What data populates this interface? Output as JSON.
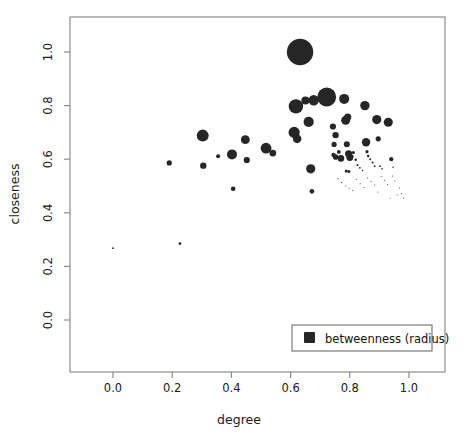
{
  "chart_data": {
    "type": "scatter",
    "title": "",
    "subtitle": "",
    "xlabel": "degree",
    "ylabel": "closeness",
    "xlim": [
      -0.115,
      1.115
    ],
    "ylim": [
      -0.135,
      1.135
    ],
    "xticks": [
      "0.0",
      "0.2",
      "0.4",
      "0.6",
      "0.8",
      "1.0"
    ],
    "xtick_values": [
      0.0,
      0.2,
      0.4,
      0.6,
      0.8,
      1.0
    ],
    "yticks": [
      "0.0",
      "0.2",
      "0.4",
      "0.6",
      "0.8",
      "1.0"
    ],
    "ytick_values": [
      0.0,
      0.2,
      0.4,
      0.6,
      0.8,
      1.0
    ],
    "grid": false,
    "legend": {
      "position": "bottom-right",
      "entries": [
        {
          "label": "betweenness (radius)",
          "marker": "square",
          "color": "#262626"
        }
      ]
    },
    "size_encoding": "betweenness (radius)",
    "marker_color": "#262626",
    "points": [
      {
        "x": 0.0,
        "y": 0.268,
        "r": 0.9
      },
      {
        "x": 0.226,
        "y": 0.285,
        "r": 1.4
      },
      {
        "x": 0.19,
        "y": 0.586,
        "r": 2.6
      },
      {
        "x": 0.303,
        "y": 0.688,
        "r": 6.0
      },
      {
        "x": 0.305,
        "y": 0.576,
        "r": 3.2
      },
      {
        "x": 0.355,
        "y": 0.611,
        "r": 2.0
      },
      {
        "x": 0.402,
        "y": 0.618,
        "r": 5.0
      },
      {
        "x": 0.406,
        "y": 0.49,
        "r": 2.3
      },
      {
        "x": 0.447,
        "y": 0.673,
        "r": 4.4
      },
      {
        "x": 0.452,
        "y": 0.597,
        "r": 3.1
      },
      {
        "x": 0.517,
        "y": 0.641,
        "r": 5.4
      },
      {
        "x": 0.54,
        "y": 0.623,
        "r": 3.4
      },
      {
        "x": 0.618,
        "y": 0.797,
        "r": 7.2
      },
      {
        "x": 0.632,
        "y": 1.0,
        "r": 13.2
      },
      {
        "x": 0.612,
        "y": 0.7,
        "r": 5.6
      },
      {
        "x": 0.622,
        "y": 0.676,
        "r": 4.3
      },
      {
        "x": 0.65,
        "y": 0.819,
        "r": 4.0
      },
      {
        "x": 0.668,
        "y": 0.564,
        "r": 4.6
      },
      {
        "x": 0.672,
        "y": 0.48,
        "r": 2.3
      },
      {
        "x": 0.661,
        "y": 0.739,
        "r": 5.1
      },
      {
        "x": 0.722,
        "y": 0.832,
        "r": 9.4
      },
      {
        "x": 0.728,
        "y": 0.824,
        "r": 5.4
      },
      {
        "x": 0.678,
        "y": 0.82,
        "r": 5.2
      },
      {
        "x": 0.743,
        "y": 0.722,
        "r": 3.1
      },
      {
        "x": 0.752,
        "y": 0.69,
        "r": 3.2
      },
      {
        "x": 0.747,
        "y": 0.655,
        "r": 2.6
      },
      {
        "x": 0.745,
        "y": 0.616,
        "r": 2.2
      },
      {
        "x": 0.752,
        "y": 0.608,
        "r": 2.8
      },
      {
        "x": 0.763,
        "y": 0.627,
        "r": 1.9
      },
      {
        "x": 0.77,
        "y": 0.603,
        "r": 3.3
      },
      {
        "x": 0.781,
        "y": 0.825,
        "r": 5.0
      },
      {
        "x": 0.786,
        "y": 0.745,
        "r": 4.5
      },
      {
        "x": 0.793,
        "y": 0.757,
        "r": 3.6
      },
      {
        "x": 0.79,
        "y": 0.656,
        "r": 3.0
      },
      {
        "x": 0.796,
        "y": 0.62,
        "r": 3.6
      },
      {
        "x": 0.8,
        "y": 0.606,
        "r": 3.4
      },
      {
        "x": 0.788,
        "y": 0.556,
        "r": 1.5
      },
      {
        "x": 0.797,
        "y": 0.554,
        "r": 1.5
      },
      {
        "x": 0.806,
        "y": 0.61,
        "r": 2.0
      },
      {
        "x": 0.812,
        "y": 0.625,
        "r": 1.6
      },
      {
        "x": 0.82,
        "y": 0.598,
        "r": 1.3
      },
      {
        "x": 0.826,
        "y": 0.578,
        "r": 1.0
      },
      {
        "x": 0.834,
        "y": 0.568,
        "r": 0.9
      },
      {
        "x": 0.843,
        "y": 0.558,
        "r": 0.8
      },
      {
        "x": 0.851,
        "y": 0.8,
        "r": 4.7
      },
      {
        "x": 0.855,
        "y": 0.663,
        "r": 4.2
      },
      {
        "x": 0.858,
        "y": 0.628,
        "r": 1.6
      },
      {
        "x": 0.862,
        "y": 0.612,
        "r": 1.2
      },
      {
        "x": 0.869,
        "y": 0.6,
        "r": 1.0
      },
      {
        "x": 0.877,
        "y": 0.588,
        "r": 1.0
      },
      {
        "x": 0.884,
        "y": 0.574,
        "r": 0.9
      },
      {
        "x": 0.891,
        "y": 0.748,
        "r": 4.6
      },
      {
        "x": 0.896,
        "y": 0.676,
        "r": 2.6
      },
      {
        "x": 0.902,
        "y": 0.574,
        "r": 0.9
      },
      {
        "x": 0.909,
        "y": 0.564,
        "r": 0.8
      },
      {
        "x": 0.93,
        "y": 0.738,
        "r": 4.5
      },
      {
        "x": 0.94,
        "y": 0.6,
        "r": 2.1
      },
      {
        "x": 0.946,
        "y": 0.57,
        "r": 0.7
      },
      {
        "x": 0.76,
        "y": 0.527,
        "r": 0.6
      },
      {
        "x": 0.772,
        "y": 0.513,
        "r": 0.6
      },
      {
        "x": 0.786,
        "y": 0.5,
        "r": 0.5
      },
      {
        "x": 0.798,
        "y": 0.492,
        "r": 0.5
      },
      {
        "x": 0.81,
        "y": 0.483,
        "r": 0.5
      },
      {
        "x": 0.822,
        "y": 0.524,
        "r": 0.5
      },
      {
        "x": 0.835,
        "y": 0.508,
        "r": 0.5
      },
      {
        "x": 0.848,
        "y": 0.494,
        "r": 0.5
      },
      {
        "x": 0.86,
        "y": 0.53,
        "r": 0.5
      },
      {
        "x": 0.872,
        "y": 0.517,
        "r": 0.5
      },
      {
        "x": 0.884,
        "y": 0.504,
        "r": 0.5
      },
      {
        "x": 0.895,
        "y": 0.478,
        "r": 0.5
      },
      {
        "x": 0.906,
        "y": 0.535,
        "r": 0.5
      },
      {
        "x": 0.917,
        "y": 0.521,
        "r": 0.5
      },
      {
        "x": 0.927,
        "y": 0.506,
        "r": 0.5
      },
      {
        "x": 0.936,
        "y": 0.455,
        "r": 0.5
      },
      {
        "x": 0.944,
        "y": 0.537,
        "r": 0.5
      },
      {
        "x": 0.952,
        "y": 0.519,
        "r": 0.5
      },
      {
        "x": 0.96,
        "y": 0.466,
        "r": 0.5
      },
      {
        "x": 0.968,
        "y": 0.493,
        "r": 0.5
      },
      {
        "x": 0.975,
        "y": 0.472,
        "r": 0.5
      },
      {
        "x": 0.982,
        "y": 0.455,
        "r": 0.5
      }
    ]
  }
}
